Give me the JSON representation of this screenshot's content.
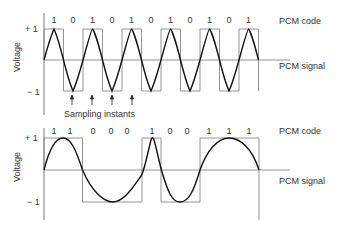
{
  "diagram": {
    "type": "pcm_waveforms",
    "panels": [
      {
        "id": "top",
        "y_axis_label": "Voltage",
        "ticks": [
          "+ 1",
          "− 1"
        ],
        "pcm_code_label": "PCM code",
        "pcm_signal_label": "PCM signal",
        "bits": [
          "1",
          "0",
          "1",
          "0",
          "1",
          "0",
          "1",
          "0",
          "1",
          "0",
          "1"
        ],
        "annotation": "Sampling instants"
      },
      {
        "id": "bottom",
        "y_axis_label": "Voltage",
        "ticks": [
          "+ 1",
          "− 1"
        ],
        "pcm_code_label": "PCM code",
        "pcm_signal_label": "PCM signal",
        "bits": [
          "1",
          "1",
          "0",
          "0",
          "0",
          "1",
          "0",
          "0",
          "1",
          "1",
          "1"
        ]
      }
    ]
  }
}
